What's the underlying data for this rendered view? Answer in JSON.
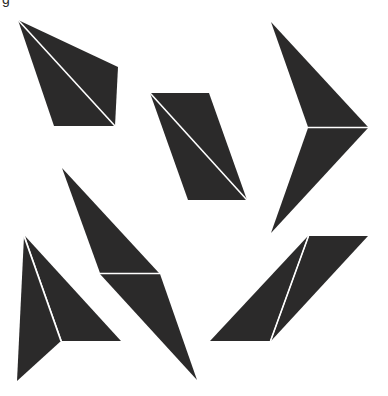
{
  "figure": {
    "label_fragment": "g",
    "fill_color": "#2b2a2a",
    "seam_color": "#ffffff",
    "background": "#ffffff",
    "shapes": [
      {
        "name": "kite-top-left",
        "pieces": [
          {
            "points": "18,20 118,67 115,126"
          },
          {
            "points": "18,20 115,126 54,126"
          }
        ],
        "seam": [
          18,
          20,
          115,
          126
        ]
      },
      {
        "name": "parallelogram-center",
        "pieces": [
          {
            "points": "150,93 209,93 247,200"
          },
          {
            "points": "150,93 247,200 188,200"
          }
        ],
        "seam": [
          150,
          93,
          247,
          200
        ]
      },
      {
        "name": "arrow-right",
        "pieces": [
          {
            "points": "271,22 368,127 308,127"
          },
          {
            "points": "308,128 368,128 271,233"
          }
        ],
        "seam": [
          308,
          127.5,
          368,
          127.5
        ]
      },
      {
        "name": "dart-center-left",
        "pieces": [
          {
            "points": "62,168 159,273 100,273"
          },
          {
            "points": "100,274 160,274 197,380"
          }
        ],
        "seam": [
          100,
          273.5,
          160,
          273.5
        ]
      },
      {
        "name": "arrowhead-bottom-left",
        "pieces": [
          {
            "points": "24,236 61,341 17,381"
          },
          {
            "points": "25,236 121,341 62,341"
          }
        ],
        "seam": [
          24,
          236,
          61,
          341
        ]
      },
      {
        "name": "parallelogram-bottom-right",
        "pieces": [
          {
            "points": "308,236 210,341 270,341"
          },
          {
            "points": "309,236 368,236 271,341"
          }
        ],
        "seam": [
          308.5,
          236,
          270.5,
          341
        ]
      }
    ]
  }
}
